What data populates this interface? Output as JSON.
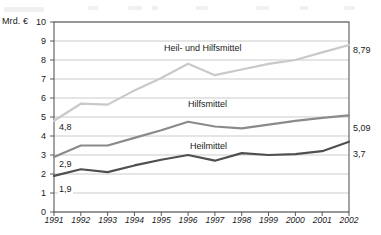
{
  "chart_data": {
    "type": "line",
    "title": "",
    "subtitle": "",
    "xlabel": "",
    "ylabel": "Mrd. €",
    "unit_label": "Mrd. €",
    "x": [
      "1991",
      "1992",
      "1993",
      "1994",
      "1995",
      "1996",
      "1997",
      "1998",
      "1999",
      "2000",
      "2001",
      "2002"
    ],
    "categories": [
      "1991",
      "1992",
      "1993",
      "1994",
      "1995",
      "1996",
      "1997",
      "1998",
      "1999",
      "2000",
      "2001",
      "2002"
    ],
    "ylim": [
      0,
      10
    ],
    "yticks": [
      "0",
      "1",
      "2",
      "3",
      "4",
      "5",
      "6",
      "7",
      "8",
      "9",
      "10"
    ],
    "grid": true,
    "grid_axis": "y",
    "legend": "inline-labels",
    "series": [
      {
        "name": "Heil- und Hilfsmittel",
        "color": "#c9c9c9",
        "values": [
          4.8,
          5.7,
          5.65,
          6.4,
          7.05,
          7.8,
          7.2,
          7.5,
          7.8,
          8.0,
          8.4,
          8.79
        ],
        "start_label": "4,8",
        "end_label": "8,79"
      },
      {
        "name": "Hilfsmittel",
        "color": "#8a8a8a",
        "values": [
          2.9,
          3.5,
          3.5,
          3.9,
          4.3,
          4.75,
          4.5,
          4.4,
          4.6,
          4.8,
          4.95,
          5.09
        ],
        "start_label": "2,9",
        "end_label": "5,09"
      },
      {
        "name": "Heilmittel",
        "color": "#4f4f4f",
        "values": [
          1.9,
          2.25,
          2.1,
          2.45,
          2.75,
          3.0,
          2.7,
          3.1,
          3.0,
          3.05,
          3.2,
          3.7
        ],
        "start_label": "1,9",
        "end_label": "3,7"
      }
    ],
    "annotations": [
      {
        "text": "Heil- und Hilfsmittel",
        "series": 0
      },
      {
        "text": "Hilfsmittel",
        "series": 1
      },
      {
        "text": "Heilmittel",
        "series": 2
      }
    ],
    "colors": {
      "heil_und_hilfsmittel": "#c9c9c9",
      "hilfsmittel": "#8a8a8a",
      "heilmittel": "#4f4f4f",
      "grid": "#b5b5b5",
      "axis": "#4a4a4a",
      "text": "#1a1a1a",
      "background": "#ffffff"
    }
  }
}
